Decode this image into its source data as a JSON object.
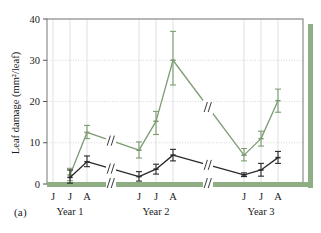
{
  "figure": {
    "panel_label": "(a)",
    "accent_color": "#8fae84",
    "series_dark_color": "#2a2a2a",
    "background": "#ffffff"
  },
  "chart_data": {
    "type": "line",
    "title": "",
    "xlabel": "",
    "ylabel": "Leaf damage (mm²/leaf)",
    "ylim": [
      0,
      40
    ],
    "yticks": [
      0,
      10,
      20,
      30,
      40
    ],
    "ytick_labels": [
      "0",
      "10",
      "20",
      "30",
      "40"
    ],
    "grid": true,
    "legend_position": "none",
    "axis_breaks": 2,
    "x": [
      "J",
      "J",
      "A",
      "J",
      "J",
      "A",
      "J",
      "J",
      "A"
    ],
    "xtick_labels": [
      "J",
      "J",
      "A",
      "J",
      "J",
      "A",
      "J",
      "J",
      "A"
    ],
    "group_labels": [
      "Year 1",
      "Year 2",
      "Year 3"
    ],
    "groups": [
      {
        "label": "Year 1",
        "ticks": [
          "J",
          "J",
          "A"
        ]
      },
      {
        "label": "Year 2",
        "ticks": [
          "J",
          "J",
          "A"
        ]
      },
      {
        "label": "Year 3",
        "ticks": [
          "J",
          "J",
          "A"
        ]
      }
    ],
    "series": [
      {
        "name": "green",
        "color": "#7d9c72",
        "values": [
          null,
          2.2,
          12.5,
          8.2,
          15.2,
          30.0,
          7.0,
          11.0,
          20.2
        ],
        "err_low": [
          null,
          0.8,
          11.0,
          6.3,
          12.0,
          24.0,
          5.6,
          9.2,
          17.4
        ],
        "err_high": [
          null,
          3.8,
          14.2,
          10.2,
          17.6,
          37.0,
          8.6,
          12.8,
          23.0
        ]
      },
      {
        "name": "dark",
        "color": "#2a2a2a",
        "values": [
          null,
          1.6,
          5.4,
          1.8,
          3.6,
          7.0,
          2.2,
          3.4,
          6.4
        ],
        "err_low": [
          null,
          0.2,
          4.2,
          0.7,
          2.4,
          5.6,
          1.8,
          1.9,
          5.0
        ],
        "err_high": [
          null,
          3.4,
          6.8,
          3.0,
          4.8,
          8.4,
          2.7,
          5.0,
          7.9
        ]
      }
    ]
  }
}
